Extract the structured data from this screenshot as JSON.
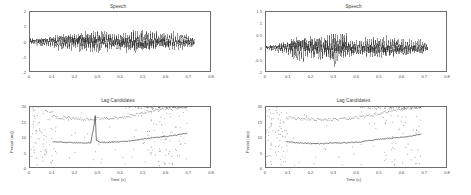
{
  "figure": {
    "background": "#ffffff",
    "axis_color": "#6d6d6d",
    "trace_color": "#1a1a1a",
    "point_color": "#808080"
  },
  "panels": {
    "top_left": {
      "title": "Speech",
      "xlabel": "",
      "ylabel": "",
      "xticks": [
        "0",
        "0.1",
        "0.2",
        "0.3",
        "0.4",
        "0.5",
        "0.6",
        "0.7",
        "0.8"
      ],
      "yticks": [
        "2",
        "1",
        "0",
        "-1",
        "-2"
      ]
    },
    "top_right": {
      "title": "Speech",
      "xlabel": "",
      "ylabel": "",
      "xticks": [
        "0",
        "0.1",
        "0.2",
        "0.3",
        "0.4",
        "0.5",
        "0.6",
        "0.7",
        "0.8"
      ],
      "yticks": [
        "1.5",
        "1",
        "0.5",
        "0",
        "-0.5",
        "-1"
      ]
    },
    "bottom_left": {
      "title": "Lag Candidates",
      "xlabel": "Time (s)",
      "ylabel": "Period (ms)",
      "xticks": [
        "0",
        "0.1",
        "0.2",
        "0.3",
        "0.4",
        "0.5",
        "0.6",
        "0.7",
        "0.8"
      ],
      "yticks": [
        "20",
        "15",
        "10",
        "5",
        "0"
      ]
    },
    "bottom_right": {
      "title": "Lag Candidates",
      "xlabel": "Time (s)",
      "ylabel": "Period (ms)",
      "xticks": [
        "0",
        "0.1",
        "0.2",
        "0.3",
        "0.4",
        "0.5",
        "0.6",
        "0.7",
        "0.8"
      ],
      "yticks": [
        "20",
        "15",
        "10",
        "5",
        "0"
      ]
    }
  },
  "chart_data": [
    {
      "id": "top_left",
      "type": "line",
      "title": "Speech",
      "xlabel": "",
      "ylabel": "",
      "xlim": [
        0,
        0.8
      ],
      "ylim": [
        -2,
        2
      ],
      "grid": false,
      "legend": null,
      "description": "Time-domain speech waveform, zero-mean, amplitude envelope growing from ~0.4 at onset to ~1.3 peak mid-utterance, ending abruptly at t=0.73 s",
      "series": [
        {
          "name": "speech waveform",
          "envelope_x": [
            0.0,
            0.05,
            0.1,
            0.15,
            0.2,
            0.25,
            0.3,
            0.35,
            0.4,
            0.45,
            0.5,
            0.55,
            0.6,
            0.65,
            0.7,
            0.73
          ],
          "envelope_upper": [
            0.35,
            0.42,
            0.62,
            0.85,
            1.0,
            1.08,
            1.15,
            0.95,
            0.8,
            1.25,
            1.2,
            1.05,
            0.95,
            0.88,
            0.8,
            0.55
          ],
          "envelope_lower": [
            -0.35,
            -0.42,
            -0.62,
            -0.85,
            -1.0,
            -1.08,
            -1.15,
            -0.95,
            -0.8,
            -1.25,
            -1.2,
            -1.05,
            -0.95,
            -0.88,
            -0.8,
            -0.55
          ]
        }
      ]
    },
    {
      "id": "top_right",
      "type": "line",
      "title": "Speech",
      "xlabel": "",
      "ylabel": "",
      "xlim": [
        0,
        0.8
      ],
      "ylim": [
        -1,
        1.5
      ],
      "grid": false,
      "legend": null,
      "description": "Time-domain speech waveform, amplitude envelope rising from ~0.2 to peak ~1.15 near t=0.30 s, ending at t=0.72 s",
      "series": [
        {
          "name": "speech waveform",
          "envelope_x": [
            0.0,
            0.05,
            0.1,
            0.15,
            0.2,
            0.25,
            0.3,
            0.35,
            0.4,
            0.45,
            0.5,
            0.55,
            0.6,
            0.65,
            0.7,
            0.72
          ],
          "envelope_upper": [
            0.15,
            0.22,
            0.55,
            0.85,
            0.75,
            0.8,
            1.1,
            0.85,
            0.5,
            0.6,
            0.78,
            0.7,
            0.62,
            0.5,
            0.42,
            0.3
          ],
          "envelope_lower": [
            -0.15,
            -0.22,
            -0.55,
            -0.85,
            -0.75,
            -0.8,
            -1.1,
            -0.85,
            -0.5,
            -0.6,
            -0.78,
            -0.7,
            -0.62,
            -0.5,
            -0.42,
            -0.3
          ]
        }
      ]
    },
    {
      "id": "bottom_left",
      "type": "scatter",
      "title": "Lag Candidates",
      "xlabel": "Time (s)",
      "ylabel": "Period (ms)",
      "xlim": [
        0,
        0.8
      ],
      "ylim": [
        0,
        20
      ],
      "grid": false,
      "legend": null,
      "description": "Lag candidate periods vs time. Dense scattered candidates in the unvoiced region t<0.1 s, then a stable dark lower track near 8 ms with a sharp spike to ~17 ms at t=0.29 s, plus an upper dotted track near 16-17 ms (octave double).",
      "series": [
        {
          "name": "primary lag track",
          "x": [
            0.1,
            0.13,
            0.16,
            0.19,
            0.22,
            0.25,
            0.27,
            0.285,
            0.29,
            0.295,
            0.31,
            0.34,
            0.37,
            0.4,
            0.43,
            0.46,
            0.49,
            0.52,
            0.55,
            0.58,
            0.61,
            0.64,
            0.67,
            0.7
          ],
          "y": [
            8.4,
            8.3,
            8.2,
            8.1,
            8.0,
            8.0,
            8.1,
            14.0,
            17.2,
            9.0,
            8.2,
            8.2,
            8.3,
            8.4,
            8.6,
            8.8,
            9.2,
            9.5,
            9.8,
            10.0,
            10.2,
            10.5,
            10.9,
            11.3
          ]
        },
        {
          "name": "octave (double) track",
          "x": [
            0.1,
            0.14,
            0.18,
            0.22,
            0.26,
            0.3,
            0.34,
            0.38,
            0.42,
            0.46,
            0.5,
            0.54,
            0.58,
            0.62,
            0.66,
            0.7
          ],
          "y": [
            16.8,
            16.4,
            16.2,
            16.1,
            16.0,
            16.1,
            16.2,
            16.3,
            16.6,
            17.2,
            18.0,
            18.8,
            19.3,
            19.6,
            19.8,
            19.9
          ]
        },
        {
          "name": "scattered candidates",
          "x_range": [
            0.0,
            0.72
          ],
          "y_range": [
            0.5,
            20.0
          ],
          "count": 180,
          "note": "densest for t<0.1 s and t>0.55 s"
        }
      ]
    },
    {
      "id": "bottom_right",
      "type": "scatter",
      "title": "Lag Candidates",
      "xlabel": "Time (s)",
      "ylabel": "Period (ms)",
      "xlim": [
        0,
        0.8
      ],
      "ylim": [
        0,
        20
      ],
      "grid": false,
      "legend": null,
      "description": "Lag candidate periods vs time. Smooth dark lower track near 8 ms rising to ~11 ms, and an upper dotted track near 16 ms rising to 20 ms; no spike artifact present.",
      "series": [
        {
          "name": "primary lag track",
          "x": [
            0.09,
            0.12,
            0.15,
            0.18,
            0.21,
            0.24,
            0.27,
            0.3,
            0.33,
            0.36,
            0.39,
            0.42,
            0.45,
            0.48,
            0.51,
            0.54,
            0.57,
            0.6,
            0.63,
            0.66,
            0.69
          ],
          "y": [
            8.4,
            8.2,
            8.0,
            7.9,
            7.8,
            7.8,
            7.9,
            8.0,
            8.0,
            8.1,
            8.2,
            8.4,
            8.7,
            9.0,
            9.3,
            9.5,
            9.7,
            9.9,
            10.1,
            10.5,
            11.0
          ]
        },
        {
          "name": "octave (double) track",
          "x": [
            0.09,
            0.13,
            0.17,
            0.21,
            0.25,
            0.29,
            0.33,
            0.37,
            0.41,
            0.45,
            0.49,
            0.53,
            0.57,
            0.61,
            0.65,
            0.69
          ],
          "y": [
            16.5,
            16.2,
            16.0,
            15.9,
            15.8,
            15.9,
            16.0,
            16.2,
            16.5,
            17.0,
            17.6,
            18.3,
            18.9,
            19.4,
            19.7,
            19.9
          ]
        },
        {
          "name": "scattered candidates",
          "x_range": [
            0.0,
            0.7
          ],
          "y_range": [
            0.5,
            20.0
          ],
          "count": 150,
          "note": "densest for t<0.1 s and t in 0.55-0.70 s"
        }
      ]
    }
  ]
}
